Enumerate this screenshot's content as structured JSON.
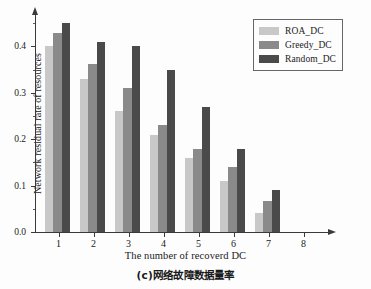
{
  "chart_data": {
    "type": "bar",
    "title": "",
    "caption": "(c)网络故障数据量率",
    "xlabel": "The number of recoverd DC",
    "ylabel": "Network residual rate of resources",
    "categories": [
      "1",
      "2",
      "3",
      "4",
      "5",
      "6",
      "7",
      "8"
    ],
    "ylim": [
      0.0,
      0.47
    ],
    "xlim": [
      0.5,
      8.5
    ],
    "grid": false,
    "legend_position": "top-right",
    "y_major_ticks": [
      "0.0",
      "0.1",
      "0.2",
      "0.3",
      "0.4"
    ],
    "y_major_tick_values": [
      0.0,
      0.1,
      0.2,
      0.3,
      0.4
    ],
    "y_minor_tick_values": [
      0.05,
      0.15,
      0.25,
      0.35,
      0.45
    ],
    "series": [
      {
        "name": "ROA_DC",
        "color": "#c8c8c8",
        "values": [
          0.4,
          0.33,
          0.26,
          0.21,
          0.16,
          0.11,
          0.04,
          0.0
        ]
      },
      {
        "name": "Greedy_DC",
        "color": "#8a8a8a",
        "values": [
          0.43,
          0.362,
          0.31,
          0.23,
          0.18,
          0.14,
          0.067,
          0.0
        ]
      },
      {
        "name": "Random_DC",
        "color": "#4a4a4a",
        "values": [
          0.45,
          0.41,
          0.4,
          0.35,
          0.27,
          0.18,
          0.09,
          0.0
        ]
      }
    ]
  },
  "axes": {
    "x_title": "The number of recoverd DC",
    "y_title": "Network residual rate of resources"
  },
  "legend": {
    "items": [
      {
        "label": "ROA_DC",
        "color": "#c8c8c8"
      },
      {
        "label": "Greedy_DC",
        "color": "#8a8a8a"
      },
      {
        "label": "Random_DC",
        "color": "#4a4a4a"
      }
    ]
  },
  "caption": {
    "text": "(c)网络故障数据量率"
  }
}
